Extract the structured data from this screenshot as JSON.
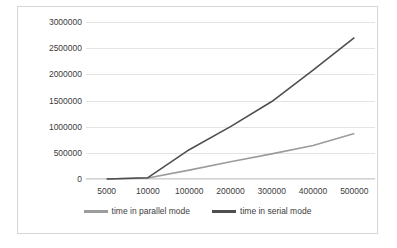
{
  "chart_data": {
    "type": "line",
    "title": "",
    "xlabel": "",
    "ylabel": "",
    "categories": [
      "5000",
      "10000",
      "100000",
      "200000",
      "300000",
      "400000",
      "500000"
    ],
    "series": [
      {
        "name": "time in parallel mode",
        "color": "#9c9c9c",
        "values": [
          0,
          20000,
          170000,
          330000,
          480000,
          640000,
          870000
        ]
      },
      {
        "name": "time in serial mode",
        "color": "#4f4f4f",
        "values": [
          0,
          25000,
          560000,
          1000000,
          1480000,
          2080000,
          2700000
        ]
      }
    ],
    "ylim": [
      0,
      3000000
    ],
    "yticks": [
      "0",
      "500000",
      "1000000",
      "1500000",
      "2000000",
      "2500000",
      "3000000"
    ],
    "ytick_values": [
      0,
      500000,
      1000000,
      1500000,
      2000000,
      2500000,
      3000000
    ],
    "grid": true,
    "legend_position": "bottom"
  },
  "colors": {
    "frame_border": "#d6d6d6",
    "gridline": "#e4e4e4",
    "axis": "#d2d2d2",
    "text": "#3c3c3c",
    "background": "#ffffff"
  }
}
